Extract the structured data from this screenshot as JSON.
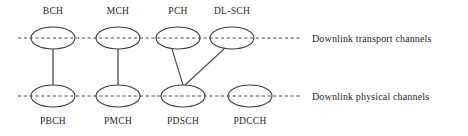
{
  "diagram": {
    "colors": {
      "background": "#ffffff",
      "stroke": "#3a3a3a",
      "dashed_line": "#4a4a4a",
      "text": "#262626"
    },
    "rows": [
      {
        "id": "transport",
        "legend": "Downlink transport channels",
        "line_y": 38,
        "nodes": [
          {
            "id": "bch",
            "label": "BCH",
            "cx": 53,
            "cy": 38,
            "rx": 22,
            "ry": 11,
            "label_x": 53,
            "label_y": 14
          },
          {
            "id": "mch",
            "label": "MCH",
            "cx": 118,
            "cy": 38,
            "rx": 22,
            "ry": 11,
            "label_x": 118,
            "label_y": 14
          },
          {
            "id": "pch",
            "label": "PCH",
            "cx": 178,
            "cy": 38,
            "rx": 22,
            "ry": 11,
            "label_x": 178,
            "label_y": 14
          },
          {
            "id": "dlsch",
            "label": "DL-SCH",
            "cx": 232,
            "cy": 38,
            "rx": 22,
            "ry": 11,
            "label_x": 232,
            "label_y": 14
          }
        ]
      },
      {
        "id": "physical",
        "legend": "Downlink physical channels",
        "line_y": 96,
        "nodes": [
          {
            "id": "pbch",
            "label": "PBCH",
            "cx": 53,
            "cy": 96,
            "rx": 22,
            "ry": 11,
            "label_x": 53,
            "label_y": 124
          },
          {
            "id": "pmch",
            "label": "PMCH",
            "cx": 118,
            "cy": 96,
            "rx": 22,
            "ry": 11,
            "label_x": 118,
            "label_y": 124
          },
          {
            "id": "pdsch",
            "label": "PDSCH",
            "cx": 183,
            "cy": 96,
            "rx": 22,
            "ry": 11,
            "label_x": 183,
            "label_y": 124
          },
          {
            "id": "pdcch",
            "label": "PDCCH",
            "cx": 250,
            "cy": 96,
            "rx": 22,
            "ry": 11,
            "label_x": 250,
            "label_y": 124
          }
        ]
      }
    ],
    "dashed_lines": [
      {
        "id": "transport-line",
        "x1": 18,
        "y1": 38,
        "x2": 300,
        "y2": 38
      },
      {
        "id": "physical-line",
        "x1": 18,
        "y1": 96,
        "x2": 300,
        "y2": 96
      }
    ],
    "legend": [
      {
        "id": "transport-legend",
        "text": "Downlink transport channels",
        "x": 312,
        "y": 42
      },
      {
        "id": "physical-legend",
        "text": "Downlink physical channels",
        "x": 312,
        "y": 100
      }
    ],
    "connections": [
      {
        "id": "bch-to-pbch",
        "from": "BCH",
        "to": "PBCH",
        "x1": 53,
        "y1": 49,
        "x2": 53,
        "y2": 85
      },
      {
        "id": "mch-to-pmch",
        "from": "MCH",
        "to": "PMCH",
        "x1": 118,
        "y1": 49,
        "x2": 118,
        "y2": 85
      },
      {
        "id": "pch-to-pdsch",
        "from": "PCH",
        "to": "PDSCH",
        "x1": 172,
        "y1": 49,
        "x2": 183,
        "y2": 85
      },
      {
        "id": "dlsch-to-pdsch",
        "from": "DL-SCH",
        "to": "PDSCH",
        "x1": 224,
        "y1": 49,
        "x2": 185,
        "y2": 85
      }
    ]
  }
}
